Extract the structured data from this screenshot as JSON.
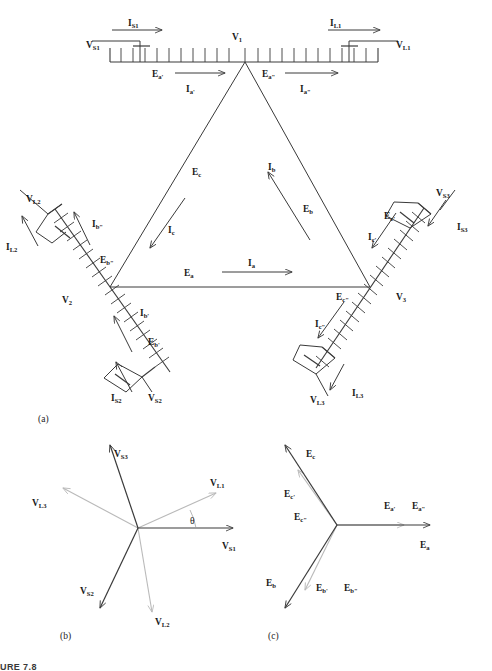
{
  "figure": {
    "caption": "URE 7.8",
    "panels": [
      {
        "id": "a",
        "label": "(a)"
      },
      {
        "id": "b",
        "label": "(b)"
      },
      {
        "id": "c",
        "label": "(c)"
      }
    ]
  },
  "colors": {
    "line": "#3a3a3a",
    "line_light": "#b9b9b9",
    "text": "#1a1a1a",
    "background": "#ffffff"
  },
  "panel_a": {
    "vertices": [
      {
        "name": "V1",
        "base": "V",
        "sub": "1"
      },
      {
        "name": "V2",
        "base": "V",
        "sub": "2"
      },
      {
        "name": "V3",
        "base": "V",
        "sub": "3"
      }
    ],
    "triangle_sides": [
      {
        "emf": {
          "base": "E",
          "sub": "a"
        },
        "current": {
          "base": "I",
          "sub": "a"
        },
        "side": "bottom"
      },
      {
        "emf": {
          "base": "E",
          "sub": "b"
        },
        "current": {
          "base": "I",
          "sub": "b"
        },
        "side": "right"
      },
      {
        "emf": {
          "base": "E",
          "sub": "c"
        },
        "current": {
          "base": "I",
          "sub": "c"
        },
        "side": "left"
      }
    ],
    "winding_1": {
      "source_voltage": {
        "base": "V",
        "sub": "S1"
      },
      "source_current": {
        "base": "I",
        "sub": "S1"
      },
      "load_voltage": {
        "base": "V",
        "sub": "L1"
      },
      "load_current": {
        "base": "I",
        "sub": "L1"
      },
      "emf_left": {
        "base": "E",
        "sub": "a'"
      },
      "emf_right": {
        "base": "E",
        "sub": "a\""
      },
      "current_left": {
        "base": "I",
        "sub": "a'"
      },
      "current_right": {
        "base": "I",
        "sub": "a\""
      }
    },
    "winding_2": {
      "source_voltage": {
        "base": "V",
        "sub": "S2"
      },
      "source_current": {
        "base": "I",
        "sub": "S2"
      },
      "load_voltage": {
        "base": "V",
        "sub": "L2"
      },
      "load_current": {
        "base": "I",
        "sub": "L2"
      },
      "emf_upper": {
        "base": "E",
        "sub": "b\""
      },
      "emf_lower": {
        "base": "E",
        "sub": "b'"
      },
      "current_upper": {
        "base": "I",
        "sub": "b\""
      },
      "current_lower": {
        "base": "I",
        "sub": "b'"
      }
    },
    "winding_3": {
      "source_voltage": {
        "base": "V",
        "sub": "S3"
      },
      "source_current": {
        "base": "I",
        "sub": "S3"
      },
      "load_voltage": {
        "base": "V",
        "sub": "L3"
      },
      "load_current": {
        "base": "I",
        "sub": "L3"
      },
      "emf_upper": {
        "base": "E",
        "sub": "c'"
      },
      "emf_lower": {
        "base": "E",
        "sub": "c\""
      },
      "current_upper": {
        "base": "I",
        "sub": "c'"
      },
      "current_lower": {
        "base": "I",
        "sub": "c\""
      }
    }
  },
  "panel_b": {
    "angle_symbol": "θ",
    "phasors": [
      {
        "label": {
          "base": "V",
          "sub": "S1"
        },
        "angle_deg": 0,
        "magnitude": 1.0,
        "style": "dark"
      },
      {
        "label": {
          "base": "V",
          "sub": "S2"
        },
        "angle_deg": 240,
        "magnitude": 1.0,
        "style": "dark"
      },
      {
        "label": {
          "base": "V",
          "sub": "S3"
        },
        "angle_deg": 110,
        "magnitude": 1.0,
        "style": "dark"
      },
      {
        "label": {
          "base": "V",
          "sub": "L1"
        },
        "angle_deg": 24,
        "magnitude": 0.82,
        "style": "light"
      },
      {
        "label": {
          "base": "V",
          "sub": "L2"
        },
        "angle_deg": 267,
        "magnitude": 0.82,
        "style": "light"
      },
      {
        "label": {
          "base": "V",
          "sub": "L3"
        },
        "angle_deg": 152,
        "magnitude": 0.82,
        "style": "light"
      }
    ]
  },
  "panel_c": {
    "phasors": [
      {
        "label": {
          "base": "E",
          "sub": "a"
        },
        "angle_deg": 0,
        "magnitude": 1.0,
        "style": "dark"
      },
      {
        "label": {
          "base": "E",
          "sub": "a'"
        },
        "angle_deg": 0,
        "magnitude": 0.8,
        "style": "light"
      },
      {
        "label": {
          "base": "E",
          "sub": "a\""
        },
        "angle_deg": 0,
        "magnitude": 0.8,
        "style": "light"
      },
      {
        "label": {
          "base": "E",
          "sub": "b"
        },
        "angle_deg": 232,
        "magnitude": 1.0,
        "style": "dark"
      },
      {
        "label": {
          "base": "E",
          "sub": "b'"
        },
        "angle_deg": 244,
        "magnitude": 0.72,
        "style": "light"
      },
      {
        "label": {
          "base": "E",
          "sub": "b\""
        },
        "angle_deg": 244,
        "magnitude": 0.72,
        "style": "light"
      },
      {
        "label": {
          "base": "E",
          "sub": "c"
        },
        "angle_deg": 118,
        "magnitude": 1.0,
        "style": "dark"
      },
      {
        "label": {
          "base": "E",
          "sub": "c'"
        },
        "angle_deg": 108,
        "magnitude": 0.72,
        "style": "light"
      },
      {
        "label": {
          "base": "E",
          "sub": "c\""
        },
        "angle_deg": 108,
        "magnitude": 0.72,
        "style": "light"
      }
    ]
  }
}
